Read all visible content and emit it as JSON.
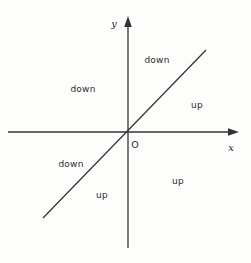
{
  "figure": {
    "type": "coordinate-plane-diagram",
    "background_color": "#fdfdfc",
    "stroke_color": "#333333",
    "text_color": "#2b2b2b",
    "width": 251,
    "height": 263
  },
  "axes": {
    "x_axis": {
      "label": "x",
      "label_x": 231,
      "label_y": 147,
      "start_x": 8,
      "start_y": 132,
      "end_x": 239,
      "end_y": 132,
      "arrow": "right"
    },
    "y_axis": {
      "label": "y",
      "label_x": 114,
      "label_y": 23,
      "start_x": 128,
      "start_y": 248,
      "end_x": 128,
      "end_y": 16,
      "arrow": "up"
    },
    "origin": {
      "label": "O",
      "label_x": 135,
      "label_y": 144,
      "x": 128,
      "y": 132
    }
  },
  "diagonal_line": {
    "x1": 43,
    "y1": 218,
    "x2": 206,
    "y2": 50,
    "description": "line through origin with positive slope"
  },
  "region_labels": [
    {
      "text": "down",
      "x": 157,
      "y": 60
    },
    {
      "text": "down",
      "x": 83,
      "y": 89
    },
    {
      "text": "down",
      "x": 71,
      "y": 164
    },
    {
      "text": "up",
      "x": 197,
      "y": 105
    },
    {
      "text": "up",
      "x": 178,
      "y": 181
    },
    {
      "text": "up",
      "x": 102,
      "y": 195
    }
  ]
}
